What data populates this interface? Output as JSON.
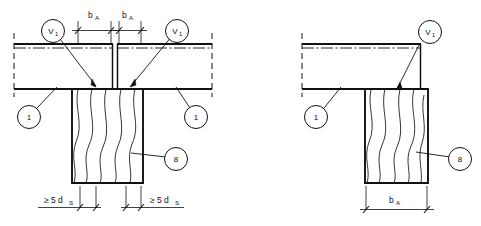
{
  "drawing": {
    "title": "Timber beam-to-column connection details",
    "stroke_color": "#111111",
    "background_color": "#ffffff",
    "views": [
      {
        "name": "continuous-beam-over-column",
        "position": "left",
        "callouts": [
          {
            "id": "v1-left",
            "text": "V",
            "sub": "1"
          },
          {
            "id": "v1-right",
            "text": "V",
            "sub": "1"
          },
          {
            "id": "part-1-left",
            "text": "1",
            "sub": ""
          },
          {
            "id": "part-1-right",
            "text": "1",
            "sub": ""
          },
          {
            "id": "part-8",
            "text": "8",
            "sub": ""
          }
        ],
        "dimensions": [
          {
            "id": "ba-left",
            "text": "b",
            "sub": "A",
            "position": "top-left"
          },
          {
            "id": "ba-right",
            "text": "b",
            "sub": "A",
            "position": "top-right"
          },
          {
            "id": "ds-left",
            "text": "≥ 5 d",
            "sub": "S",
            "position": "bottom-left"
          },
          {
            "id": "ds-right",
            "text": "≥ 5 d",
            "sub": "S",
            "position": "bottom-right"
          }
        ]
      },
      {
        "name": "beam-end-on-column",
        "position": "right",
        "callouts": [
          {
            "id": "v1",
            "text": "V",
            "sub": "1"
          },
          {
            "id": "part-1",
            "text": "1",
            "sub": ""
          },
          {
            "id": "part-8",
            "text": "8",
            "sub": ""
          }
        ],
        "dimensions": [
          {
            "id": "ba",
            "text": "b",
            "sub": "A",
            "position": "bottom"
          }
        ]
      }
    ]
  }
}
